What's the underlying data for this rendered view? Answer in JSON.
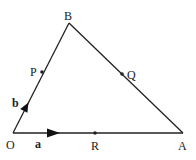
{
  "diagram": {
    "type": "vector-triangle",
    "vertices": {
      "O": {
        "label": "O",
        "x": 13,
        "y": 133
      },
      "A": {
        "label": "A",
        "x": 183,
        "y": 133
      },
      "B": {
        "label": "B",
        "x": 69,
        "y": 23
      }
    },
    "points": {
      "P": {
        "label": "P",
        "on": "OB",
        "x": 42,
        "y": 72
      },
      "Q": {
        "label": "Q",
        "on": "AB",
        "x": 122,
        "y": 74
      },
      "R": {
        "label": "R",
        "on": "OA",
        "x": 95,
        "y": 133
      }
    },
    "vectors": {
      "a": {
        "label": "a",
        "along": "OA"
      },
      "b": {
        "label": "b",
        "along": "OB"
      }
    },
    "edges": [
      "OA",
      "OB",
      "AB"
    ],
    "colors": {
      "stroke": "#222222",
      "background": "#ffffff"
    }
  }
}
